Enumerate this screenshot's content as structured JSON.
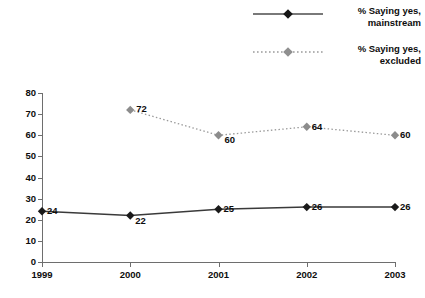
{
  "chart_data": {
    "type": "line",
    "title": "",
    "xlabel": "",
    "ylabel": "",
    "categories": [
      "1999",
      "2000",
      "2001",
      "2002",
      "2003"
    ],
    "x": [
      1999,
      2000,
      2001,
      2002,
      2003
    ],
    "ylim": [
      0,
      80
    ],
    "yticks": [
      0,
      10,
      20,
      30,
      40,
      50,
      60,
      70,
      80
    ],
    "ytick_labels": [
      "0",
      "10",
      "20",
      "30",
      "40",
      "50",
      "60",
      "70",
      "80"
    ],
    "grid": false,
    "legend_position": "top-right",
    "series": [
      {
        "name": "% Saying yes, mainstream",
        "name_line1": "% Saying yes,",
        "name_line2": "mainstream",
        "color": "#1a1a1a",
        "line_style": "solid",
        "marker": "diamond",
        "values": [
          24,
          22,
          25,
          26,
          26
        ],
        "point_labels": [
          "24",
          "22",
          "25",
          "26",
          "26"
        ]
      },
      {
        "name": "% Saying yes, excluded",
        "name_line1": "% Saying yes,",
        "name_line2": "excluded",
        "color": "#8c8c8c",
        "line_style": "dotted",
        "marker": "diamond",
        "values": [
          null,
          72,
          60,
          64,
          60
        ],
        "point_labels": [
          "",
          "72",
          "60",
          "64",
          "60"
        ]
      }
    ]
  },
  "colors": {
    "mainstream": "#1a1a1a",
    "excluded": "#8c8c8c",
    "axis": "#6e6e6e",
    "text": "#0d0d0d",
    "background": "#ffffff"
  }
}
